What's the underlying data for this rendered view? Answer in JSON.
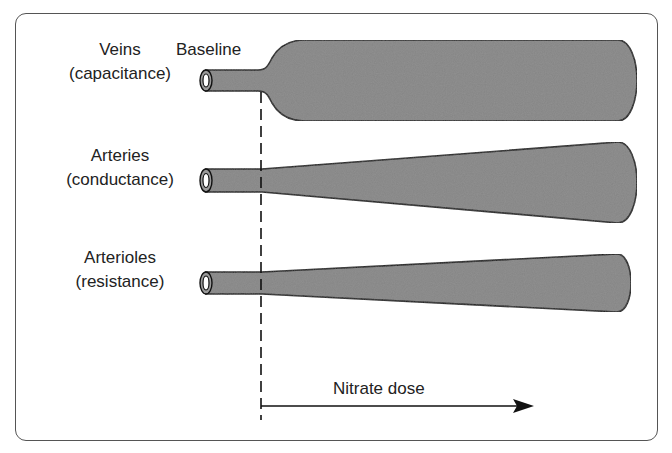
{
  "diagram": {
    "baseline_label": "Baseline",
    "axis_label": "Nitrate dose",
    "vessels": [
      {
        "name": "Veins",
        "role": "(capacitance)"
      },
      {
        "name": "Arteries",
        "role": "(conductance)"
      },
      {
        "name": "Arterioles",
        "role": "(resistance)"
      }
    ],
    "colors": {
      "vessel_fill": "#858585",
      "outline": "#111111",
      "border": "#555555"
    }
  }
}
